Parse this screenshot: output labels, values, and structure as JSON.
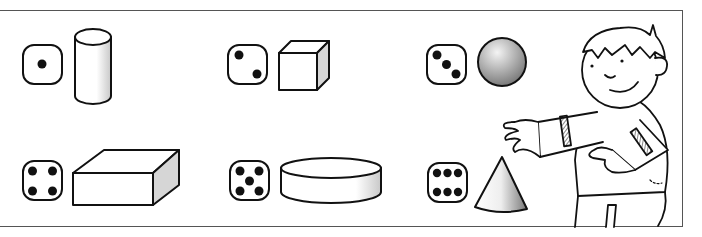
{
  "worksheet": {
    "type": "dice-to-shape matching exercise",
    "colors": {
      "line": "#111111",
      "frame": "#555555",
      "shade": "#d0d0d0"
    },
    "items": [
      {
        "die_value": 1,
        "shape": "cylinder"
      },
      {
        "die_value": 2,
        "shape": "cube"
      },
      {
        "die_value": 3,
        "shape": "sphere"
      },
      {
        "die_value": 4,
        "shape": "rectangular-prism"
      },
      {
        "die_value": 5,
        "shape": "flat-cylinder"
      },
      {
        "die_value": 6,
        "shape": "cone"
      }
    ],
    "character": "boy-presenting-shapes"
  }
}
